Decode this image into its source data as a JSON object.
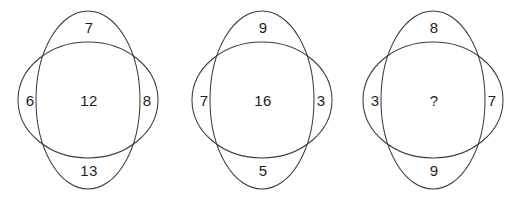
{
  "image": {
    "title": "Number puzzle with three overlapping-ellipse figures",
    "background_color": "#ffffff",
    "stroke_color": "#3c3c3c",
    "text_color": "#1e1e1e",
    "width": 531,
    "height": 200
  },
  "figures": [
    {
      "id": "figure-1",
      "center_x": 90,
      "top": "7",
      "left": "6",
      "center": "12",
      "right": "8",
      "bottom": "13"
    },
    {
      "id": "figure-2",
      "center_x": 263,
      "top": "9",
      "left": "7",
      "center": "16",
      "right": "3",
      "bottom": "5"
    },
    {
      "id": "figure-3",
      "center_x": 434,
      "top": "8",
      "left": "3",
      "center": "?",
      "right": "7",
      "bottom": "9"
    }
  ],
  "geometry": {
    "vertical_ellipse": {
      "cx": 88,
      "cy": 100,
      "rx": 52,
      "ry": 89
    },
    "horizontal_ellipse": {
      "cx": 88,
      "cy": 100,
      "rx": 70,
      "ry": 58
    },
    "label_offsets": {
      "left_x": 30,
      "right_x": 146
    }
  }
}
